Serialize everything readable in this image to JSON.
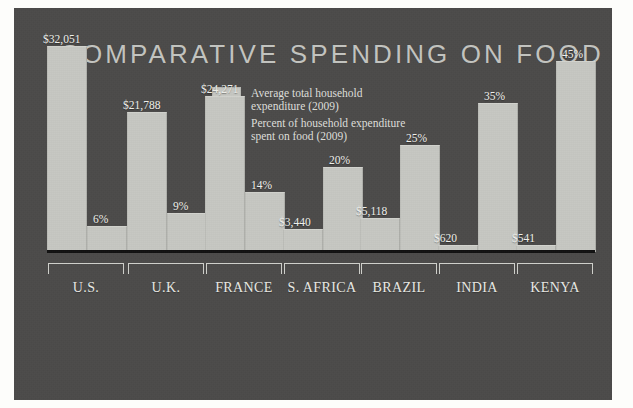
{
  "colors": {
    "panel_bg": "#4c4b4a",
    "bar_fill": "#c6c7c2",
    "title_color": "#c3c4c0",
    "label_color": "#f0f1ec",
    "baseline": "#111111",
    "page_bg": "#fdfdfb"
  },
  "title": "COMPARATIVE SPENDING ON FOOD",
  "legend": [
    {
      "label": "Average total household\nexpenditure (2009)"
    },
    {
      "label": "Percent of household expenditure\nspent on food (2009)"
    }
  ],
  "chart_data": {
    "type": "bar",
    "title": "COMPARATIVE SPENDING ON FOOD",
    "xlabel": "",
    "ylabel": "",
    "grid": false,
    "legend_position": "top-center",
    "categories": [
      "U.S.",
      "U.K.",
      "FRANCE",
      "S. AFRICA",
      "BRAZIL",
      "INDIA",
      "KENYA"
    ],
    "series": [
      {
        "name": "Average total household expenditure (2009)",
        "unit": "USD",
        "values": [
          32051,
          21788,
          24271,
          3440,
          5118,
          620,
          541
        ],
        "labels": [
          "$32,051",
          "$21,788",
          "$24,271",
          "$3,440",
          "$5,118",
          "$620",
          "$541"
        ]
      },
      {
        "name": "Percent of household expenditure spent on food (2009)",
        "unit": "percent",
        "values": [
          6,
          9,
          14,
          20,
          25,
          35,
          45
        ],
        "labels": [
          "6%",
          "9%",
          "14%",
          "20%",
          "25%",
          "35%",
          "45%"
        ]
      }
    ]
  }
}
